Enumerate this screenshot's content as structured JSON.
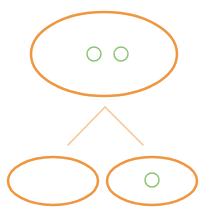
{
  "diagram": {
    "type": "tree",
    "colors": {
      "node_stroke": "#f0963f",
      "edge_stroke": "#f7c48f",
      "token_stroke": "#8cc673",
      "background": "#ffffff"
    },
    "root": {
      "cx": 104,
      "cy": 54,
      "rx": 73,
      "ry": 42,
      "tokens": [
        {
          "cx": 94,
          "cy": 54,
          "r": 7
        },
        {
          "cx": 121,
          "cy": 54,
          "r": 7
        }
      ]
    },
    "edges": [
      {
        "x1": 105,
        "y1": 107,
        "x2": 68,
        "y2": 145
      },
      {
        "x1": 105,
        "y1": 107,
        "x2": 143,
        "y2": 145
      }
    ],
    "children": [
      {
        "name": "left",
        "cx": 53,
        "cy": 181,
        "rx": 45,
        "ry": 24,
        "tokens": []
      },
      {
        "name": "right",
        "cx": 152,
        "cy": 181,
        "rx": 45,
        "ry": 24,
        "tokens": [
          {
            "cx": 152,
            "cy": 180,
            "r": 7
          }
        ]
      }
    ]
  }
}
